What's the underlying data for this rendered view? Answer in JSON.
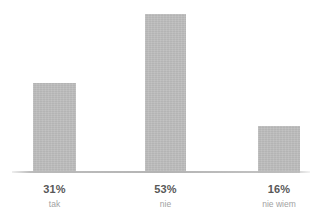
{
  "chart_data": {
    "type": "bar",
    "title": "",
    "subtitle": "",
    "xlabel": "",
    "ylabel": "",
    "categories": [
      "tak",
      "nie",
      "nie wiem"
    ],
    "values": [
      31,
      53,
      16
    ],
    "value_labels": [
      "31%",
      "53%",
      "16%"
    ],
    "ylim": [
      0,
      58
    ],
    "grid": false,
    "legend": null,
    "annotations": [],
    "colors": {
      "bar_fill": "#bcbcbc",
      "baseline": "#b4b4b4",
      "value_text": "#585858",
      "category_text": "#a2a2a2",
      "background": "#ffffff"
    }
  },
  "bars": [
    {
      "category": "tak",
      "value": 31,
      "value_label": "31%",
      "left_px": 33,
      "width_px": 43,
      "height_px": 90
    },
    {
      "category": "nie",
      "value": 53,
      "value_label": "53%",
      "left_px": 145,
      "width_px": 41,
      "height_px": 159
    },
    {
      "category": "nie wiem",
      "value": 16,
      "value_label": "16%",
      "left_px": 258,
      "width_px": 42,
      "height_px": 47
    }
  ]
}
